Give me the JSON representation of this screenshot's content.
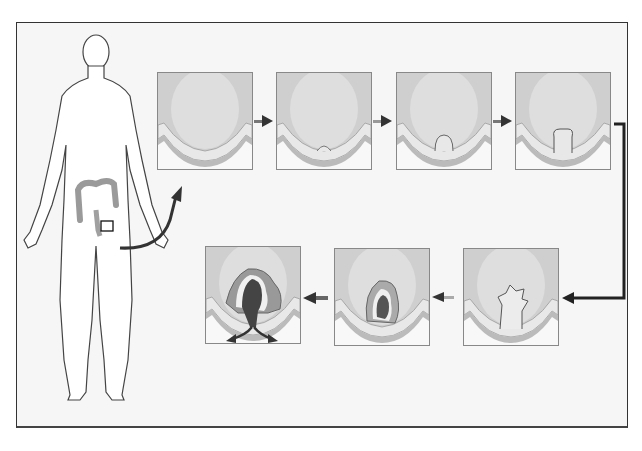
{
  "figure": {
    "caption": "",
    "colors": {
      "frame_border": "#333333",
      "background": "#f6f6f6",
      "lumen": "#d2d2d2",
      "tissue_light": "#e4e4e4",
      "tissue_mid": "#c4c4c4",
      "tumor": "#555555",
      "arrow": "#333333"
    }
  },
  "body": {
    "label": "human-body-outline",
    "colon_highlight_box": true
  },
  "stages": [
    {
      "id": 1,
      "label": "normal-lining"
    },
    {
      "id": 2,
      "label": "small-growth"
    },
    {
      "id": 3,
      "label": "polyp"
    },
    {
      "id": 4,
      "label": "enlarged-polyp"
    },
    {
      "id": 5,
      "label": "irregular-polyp"
    },
    {
      "id": 6,
      "label": "early-tumor"
    },
    {
      "id": 7,
      "label": "invasive-tumor"
    }
  ]
}
